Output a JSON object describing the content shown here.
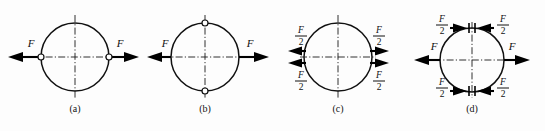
{
  "figure": {
    "force_symbol": "F",
    "half_force": {
      "numerator": "F",
      "denominator": "2"
    },
    "colors": {
      "outline": "#111111",
      "centerline": "#1a1a1a",
      "arrow": "#000000",
      "background": "#fdfdfd",
      "pin_fill": "#ffffff"
    }
  },
  "panels": [
    {
      "id": "a",
      "caption": "(a)",
      "description": "Ring with two collinear tensile forces F applied at pinned points on the horizontal diameter",
      "markers": "horizontal-pins",
      "arrows": [
        {
          "name": "left-force",
          "label": "F",
          "direction": "left",
          "side": "left"
        },
        {
          "name": "right-force",
          "label": "F",
          "direction": "right",
          "side": "right"
        }
      ]
    },
    {
      "id": "b",
      "caption": "(b)",
      "description": "Ring with forces F applied on the horizontal diameter and pin markers on the vertical diameter",
      "markers": "vertical-pins",
      "arrows": [
        {
          "name": "left-force",
          "label": "F",
          "direction": "left",
          "side": "left"
        },
        {
          "name": "right-force",
          "label": "F",
          "direction": "right",
          "side": "right"
        }
      ]
    },
    {
      "id": "c",
      "caption": "(c)",
      "description": "Ring split into two half forces F/2 above and below the horizontal centerline on each side",
      "markers": "none",
      "arrows": [
        {
          "name": "left-upper-half-force",
          "label": "F/2",
          "direction": "left",
          "side": "left",
          "position": "upper"
        },
        {
          "name": "left-lower-half-force",
          "label": "F/2",
          "direction": "left",
          "side": "left",
          "position": "lower"
        },
        {
          "name": "right-upper-half-force",
          "label": "F/2",
          "direction": "right",
          "side": "right",
          "position": "upper"
        },
        {
          "name": "right-lower-half-force",
          "label": "F/2",
          "direction": "right",
          "side": "right",
          "position": "lower"
        }
      ]
    },
    {
      "id": "d",
      "caption": "(d)",
      "description": "Ring with whole forces F outward on the horizontal diameter and paired inward half forces F/2 at the top and bottom cut sections",
      "markers": "cut-ticks",
      "arrows": [
        {
          "name": "left-force",
          "label": "F",
          "direction": "left",
          "side": "left"
        },
        {
          "name": "right-force",
          "label": "F",
          "direction": "right",
          "side": "right"
        },
        {
          "name": "top-left-half-force",
          "label": "F/2",
          "direction": "right",
          "side": "top-left"
        },
        {
          "name": "top-right-half-force",
          "label": "F/2",
          "direction": "left",
          "side": "top-right"
        },
        {
          "name": "bottom-left-half-force",
          "label": "F/2",
          "direction": "right",
          "side": "bottom-left"
        },
        {
          "name": "bottom-right-half-force",
          "label": "F/2",
          "direction": "left",
          "side": "bottom-right"
        }
      ]
    }
  ]
}
